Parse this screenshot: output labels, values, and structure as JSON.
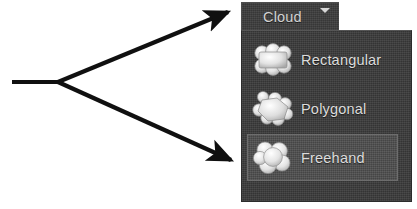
{
  "canvas": {
    "width": 417,
    "height": 209,
    "background_color": "#ffffff"
  },
  "annotation": {
    "type": "callout-arrows",
    "color": "#101010",
    "stem_label": "",
    "arrows": [
      {
        "name": "arrow-to-cloud-button",
        "points": "to cloud dropdown button"
      },
      {
        "name": "arrow-to-freehand-item",
        "points": "to freehand menu item"
      }
    ]
  },
  "toolbar": {
    "cloud_button": {
      "label": "Cloud",
      "caret_icon": "chevron-down-icon",
      "background_color": "#3c3c3c",
      "text_color": "#d2d2d2",
      "expanded": true
    }
  },
  "dropdown": {
    "name": "cloud-shape-menu",
    "background_color": "#3a3a3a",
    "border_color": "#2c2c2c",
    "highlight_color": "#4b4b4b",
    "highlight_border_color": "#6d6d6d",
    "items": [
      {
        "label": "Rectangular",
        "icon": "cloud-rectangular-icon",
        "selected": false
      },
      {
        "label": "Polygonal",
        "icon": "cloud-polygonal-icon",
        "selected": false
      },
      {
        "label": "Freehand",
        "icon": "cloud-freehand-icon",
        "selected": true
      }
    ]
  }
}
